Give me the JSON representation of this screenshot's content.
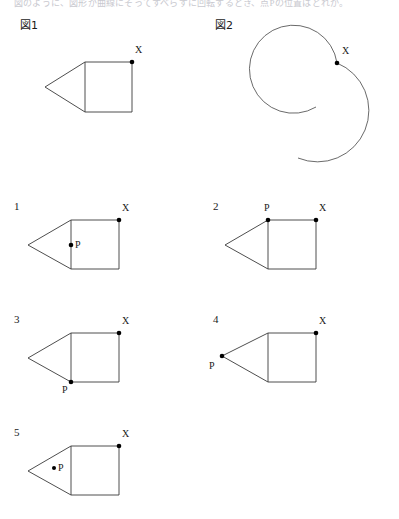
{
  "page": {
    "width": 399,
    "height": 519,
    "background": "#ffffff",
    "ink_color": "#3a3a3a",
    "dot_color": "#000000",
    "header_text": "図のように、図形が曲線にそってすべらずに回転するとき、点Pの位置はどれか。"
  },
  "figures": [
    {
      "id": "figure-1",
      "label": "図1",
      "label_x": 20,
      "label_y": 20,
      "shape": "pentagon-square-with-triangle",
      "square": {
        "left": 85,
        "top": 62,
        "right": 132,
        "bottom": 112
      },
      "apex": {
        "x": 45,
        "y": 87
      },
      "points": [
        {
          "name": "X",
          "x": 132,
          "y": 62,
          "label": "X",
          "label_x": 135,
          "label_y": 44
        }
      ]
    },
    {
      "id": "figure-2",
      "label": "図2",
      "label_x": 215,
      "label_y": 20,
      "shape": "two-arcs",
      "arcs": [
        {
          "name": "upper-left-arc",
          "cx": 297,
          "cy": 70,
          "r": 44,
          "start_deg": 57,
          "end_deg": 295
        },
        {
          "name": "lower-right-arc",
          "cx": 343,
          "cy": 113,
          "r": 51,
          "start_deg": -103,
          "end_deg": 152
        }
      ],
      "points": [
        {
          "name": "X",
          "x": 337,
          "y": 63,
          "label": "X",
          "label_x": 342,
          "label_y": 45
        }
      ]
    }
  ],
  "options": [
    {
      "number": "1",
      "num_x": 14,
      "num_y": 200,
      "square": {
        "left": 71,
        "top": 220,
        "right": 119,
        "bottom": 269
      },
      "apex": {
        "x": 28,
        "y": 245
      },
      "x_point": {
        "x": 119,
        "y": 220,
        "label": "X",
        "label_x": 122,
        "label_y": 203
      },
      "p_point": {
        "x": 71,
        "y": 245,
        "label": "P",
        "label_x": 75,
        "label_y": 240
      },
      "p_description": "P on left edge of square, midpoint"
    },
    {
      "number": "2",
      "num_x": 213,
      "num_y": 200,
      "square": {
        "left": 268,
        "top": 220,
        "right": 316,
        "bottom": 269
      },
      "apex": {
        "x": 225,
        "y": 245
      },
      "x_point": {
        "x": 316,
        "y": 220,
        "label": "X",
        "label_x": 319,
        "label_y": 203
      },
      "p_point": {
        "x": 268,
        "y": 220,
        "label": "P",
        "label_x": 265,
        "label_y": 203
      },
      "p_description": "P at top-left corner of square"
    },
    {
      "number": "3",
      "num_x": 14,
      "num_y": 313,
      "square": {
        "left": 71,
        "top": 333,
        "right": 119,
        "bottom": 382
      },
      "apex": {
        "x": 28,
        "y": 358
      },
      "x_point": {
        "x": 119,
        "y": 333,
        "label": "X",
        "label_x": 122,
        "label_y": 316
      },
      "p_point": {
        "x": 71,
        "y": 382,
        "label": "P",
        "label_x": 62,
        "label_y": 385
      },
      "p_description": "P at bottom-left corner of square"
    },
    {
      "number": "4",
      "num_x": 213,
      "num_y": 313,
      "square": {
        "left": 268,
        "top": 333,
        "right": 316,
        "bottom": 382
      },
      "apex": {
        "x": 222,
        "y": 356
      },
      "x_point": {
        "x": 316,
        "y": 333,
        "label": "X",
        "label_x": 319,
        "label_y": 316
      },
      "p_point": {
        "x": 222,
        "y": 356,
        "label": "P",
        "label_x": 209,
        "label_y": 362
      },
      "p_description": "P at triangle apex (leftmost vertex)"
    },
    {
      "number": "5",
      "num_x": 14,
      "num_y": 426,
      "square": {
        "left": 71,
        "top": 446,
        "right": 119,
        "bottom": 495
      },
      "apex": {
        "x": 28,
        "y": 471
      },
      "x_point": {
        "x": 119,
        "y": 446,
        "label": "X",
        "label_x": 122,
        "label_y": 429
      },
      "p_point": {
        "x": 54,
        "y": 468,
        "label": "P",
        "label_x": 58,
        "label_y": 464
      },
      "p_description": "P inside triangle interior"
    }
  ]
}
